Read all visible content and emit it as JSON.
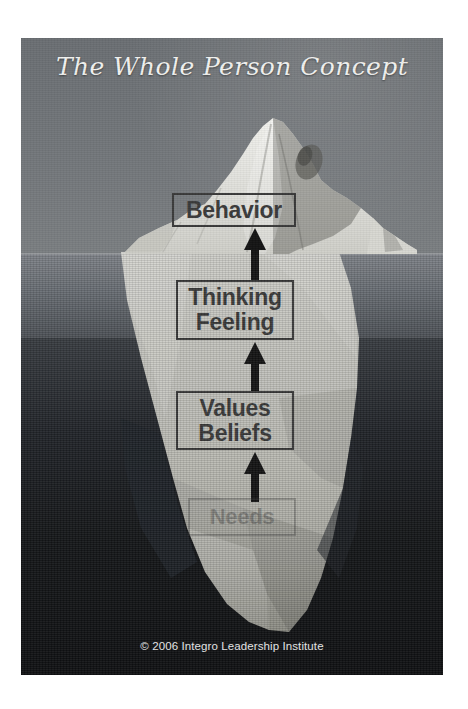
{
  "poster": {
    "title": "The Whole Person Concept",
    "copyright": "© 2006 Integro Leadership Institute",
    "colors": {
      "sky": "#6f7377",
      "sea_upper": "#6a6f75",
      "sea_deep": "#151719",
      "iceberg_above": "#e8e8e4",
      "iceberg_below": "#bdbdb8",
      "box_border": "#3a3a3a",
      "box_text": "#3b3b3b",
      "title_text": "#f2f2f0",
      "arrow": "#1b1b1b"
    }
  },
  "diagram": {
    "type": "iceberg-layers",
    "waterline_label": "waterline",
    "layers": [
      {
        "id": "behavior",
        "lines": [
          "Behavior"
        ],
        "position": "above-water",
        "visible": true,
        "faded": false
      },
      {
        "id": "thinking-feeling",
        "lines": [
          "Thinking",
          "Feeling"
        ],
        "position": "below-water",
        "visible": true,
        "faded": false
      },
      {
        "id": "values-beliefs",
        "lines": [
          "Values",
          "Beliefs"
        ],
        "position": "below-water",
        "visible": true,
        "faded": false
      },
      {
        "id": "needs",
        "lines": [
          "Needs"
        ],
        "position": "below-water-deep",
        "visible": true,
        "faded": true
      }
    ],
    "arrows": [
      {
        "id": "needs-to-values",
        "from": "needs",
        "to": "values-beliefs",
        "direction": "up"
      },
      {
        "id": "values-to-thinking",
        "from": "values-beliefs",
        "to": "thinking-feeling",
        "direction": "up"
      },
      {
        "id": "thinking-to-behavior",
        "from": "thinking-feeling",
        "to": "behavior",
        "direction": "up"
      }
    ]
  }
}
